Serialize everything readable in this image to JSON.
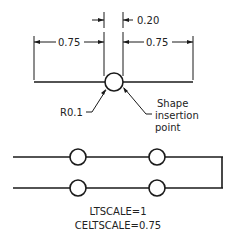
{
  "diagram": {
    "dimensions": {
      "gap": "0.20",
      "left": "0.75",
      "right": "0.75"
    },
    "labels": {
      "radius": "R0.1",
      "shape_line1": "Shape",
      "shape_line2": "insertion",
      "shape_line3": "point"
    },
    "settings": {
      "ltscale": "LTSCALE=1",
      "celtscale": "CELTSCALE=0.75"
    }
  }
}
